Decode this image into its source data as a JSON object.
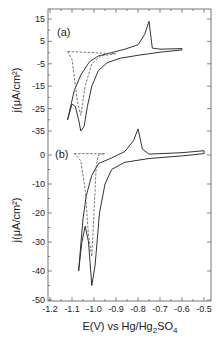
{
  "chart_data": {
    "type": "line",
    "xlabel": "E(V) vs Hg/Hg2SO4",
    "xlabel_parts": {
      "pre": "E(V) vs Hg/Hg",
      "sub1": "2",
      "mid": "SO",
      "sub2": "4"
    },
    "xlim": [
      -1.2,
      -0.45
    ],
    "xticks": [
      -1.2,
      -1.1,
      -1.0,
      -0.9,
      -0.8,
      -0.7,
      -0.6,
      -0.5
    ],
    "xtick_labels": [
      "-1.2",
      "-1.1",
      "-1.0",
      "-0.9",
      "-0.8",
      "-0.7",
      "-0.6",
      "-0.5"
    ],
    "grid": false,
    "panels": [
      {
        "label": "(a)",
        "ylabel": "j(μA/cm²)",
        "ylim": [
          -40,
          20
        ],
        "yticks": [
          15,
          5,
          -5,
          -15,
          -25,
          -35
        ],
        "ytick_labels": [
          "15",
          "5",
          "-5",
          "-15",
          "-25",
          "-35"
        ],
        "series": [
          {
            "name": "solid CV",
            "style": "solid",
            "points": [
              [
                -1.12,
                -30
              ],
              [
                -1.1,
                -23
              ],
              [
                -1.085,
                -24
              ],
              [
                -1.07,
                -30
              ],
              [
                -1.06,
                -35
              ],
              [
                -1.045,
                -33
              ],
              [
                -1.03,
                -24
              ],
              [
                -1.01,
                -15
              ],
              [
                -0.98,
                -8
              ],
              [
                -0.94,
                -4.5
              ],
              [
                -0.88,
                -2.5
              ],
              [
                -0.8,
                -1.2
              ],
              [
                -0.7,
                0.2
              ],
              [
                -0.6,
                1.2
              ],
              [
                -0.6,
                1.8
              ],
              [
                -0.7,
                1.5
              ],
              [
                -0.735,
                2
              ],
              [
                -0.75,
                14
              ],
              [
                -0.77,
                8
              ],
              [
                -0.8,
                3.5
              ],
              [
                -0.86,
                1.5
              ],
              [
                -0.92,
                0
              ],
              [
                -0.98,
                -1.5
              ],
              [
                -1.02,
                -4
              ],
              [
                -1.06,
                -10
              ],
              [
                -1.09,
                -17
              ],
              [
                -1.12,
                -30
              ]
            ]
          },
          {
            "name": "dashed CV",
            "style": "dashed",
            "points": [
              [
                -1.12,
                0.5
              ],
              [
                -0.9,
                -0.5
              ],
              [
                -0.97,
                -1.5
              ],
              [
                -1.01,
                -5
              ],
              [
                -1.04,
                -15
              ],
              [
                -1.06,
                -28
              ],
              [
                -1.075,
                -22
              ],
              [
                -1.1,
                -3
              ],
              [
                -1.12,
                0.5
              ]
            ]
          }
        ]
      },
      {
        "label": "(b)",
        "ylabel": "j(μA/cm²)",
        "ylim": [
          -50,
          5
        ],
        "yticks": [
          0,
          -10,
          -20,
          -30,
          -40,
          -50
        ],
        "ytick_labels": [
          "0",
          "-10",
          "-20",
          "-30",
          "-40",
          "-50"
        ],
        "series": [
          {
            "name": "solid CV",
            "style": "solid",
            "points": [
              [
                -1.07,
                -40
              ],
              [
                -1.055,
                -30
              ],
              [
                -1.04,
                -24.5
              ],
              [
                -1.025,
                -30
              ],
              [
                -1.01,
                -45
              ],
              [
                -0.995,
                -38
              ],
              [
                -0.975,
                -20
              ],
              [
                -0.95,
                -10
              ],
              [
                -0.92,
                -5
              ],
              [
                -0.86,
                -2.5
              ],
              [
                -0.75,
                -1.2
              ],
              [
                -0.6,
                -0.3
              ],
              [
                -0.5,
                0.5
              ],
              [
                -0.5,
                1.5
              ],
              [
                -0.6,
                0.8
              ],
              [
                -0.75,
                0.3
              ],
              [
                -0.78,
                2
              ],
              [
                -0.8,
                9
              ],
              [
                -0.82,
                5
              ],
              [
                -0.86,
                1.2
              ],
              [
                -0.92,
                -1
              ],
              [
                -0.98,
                -3
              ],
              [
                -1.01,
                -7
              ],
              [
                -1.035,
                -14
              ],
              [
                -1.05,
                -22
              ],
              [
                -1.07,
                -40
              ]
            ]
          },
          {
            "name": "dashed CV",
            "style": "dashed",
            "points": [
              [
                -1.09,
                0.5
              ],
              [
                -0.95,
                0.5
              ],
              [
                -0.98,
                0
              ],
              [
                -0.99,
                -4
              ],
              [
                -1.0,
                -20
              ],
              [
                -1.01,
                -35
              ],
              [
                -1.025,
                -28
              ],
              [
                -1.04,
                -12
              ],
              [
                -1.06,
                -2
              ],
              [
                -1.09,
                0.5
              ]
            ]
          }
        ]
      }
    ]
  }
}
